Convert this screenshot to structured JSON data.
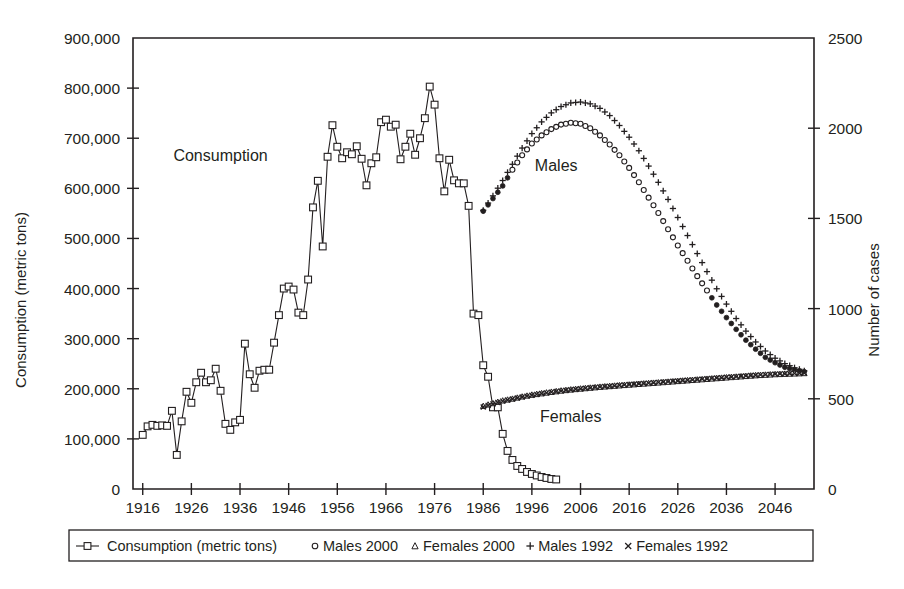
{
  "chart_data": {
    "type": "line",
    "title": "",
    "subtitle": "",
    "xlabel": "",
    "ylabel": "Consumption (metric tons)",
    "y2label": "Number of cases",
    "xlim": [
      1914,
      2054
    ],
    "ylim": [
      0,
      900000
    ],
    "y2lim": [
      0,
      2500
    ],
    "grid": false,
    "legend_position": "bottom",
    "x_ticks": [
      1916,
      1926,
      1936,
      1946,
      1956,
      1966,
      1976,
      1986,
      1996,
      2006,
      2016,
      2026,
      2036,
      2046
    ],
    "x_tick_labels": [
      "1916",
      "1926",
      "1936",
      "1946",
      "1956",
      "1966",
      "1976",
      "1986",
      "1996",
      "2006",
      "2016",
      "2026",
      "2036",
      "2046"
    ],
    "y_ticks": [
      0,
      100000,
      200000,
      300000,
      400000,
      500000,
      600000,
      700000,
      800000,
      900000
    ],
    "y_tick_labels": [
      "0",
      "100,000",
      "200,000",
      "300,000",
      "400,000",
      "500,000",
      "600,000",
      "700,000",
      "800,000",
      "900,000"
    ],
    "y2_ticks": [
      0,
      500,
      1000,
      1500,
      2000,
      2500
    ],
    "y2_tick_labels": [
      "0",
      "500",
      "1000",
      "1500",
      "2000",
      "2500"
    ],
    "annotations": [
      {
        "text": "Consumption",
        "x": 1932,
        "y": 655000,
        "axis": "left"
      },
      {
        "text": "Males",
        "x": 2001,
        "y": 1760,
        "axis": "right"
      },
      {
        "text": "Females",
        "x": 2004,
        "y": 370,
        "axis": "right"
      }
    ],
    "series": [
      {
        "name": "Consumption (metric tons)",
        "axis": "left",
        "marker": "open-square",
        "line": true,
        "x": [
          1916,
          1917,
          1918,
          1919,
          1920,
          1921,
          1922,
          1923,
          1924,
          1925,
          1926,
          1927,
          1928,
          1929,
          1930,
          1931,
          1932,
          1933,
          1934,
          1935,
          1936,
          1937,
          1938,
          1939,
          1940,
          1941,
          1942,
          1943,
          1944,
          1945,
          1946,
          1947,
          1948,
          1949,
          1950,
          1951,
          1952,
          1953,
          1954,
          1955,
          1956,
          1957,
          1958,
          1959,
          1960,
          1961,
          1962,
          1963,
          1964,
          1965,
          1966,
          1967,
          1968,
          1969,
          1970,
          1971,
          1972,
          1973,
          1974,
          1975,
          1976,
          1977,
          1978,
          1979,
          1980,
          1981,
          1982,
          1983,
          1984,
          1985,
          1986,
          1987,
          1988,
          1989,
          1990,
          1991,
          1992,
          1993,
          1994,
          1995,
          1996,
          1997,
          1998,
          1999,
          2000,
          2001
        ],
        "values": [
          108000,
          125000,
          128000,
          126000,
          127000,
          126000,
          156000,
          68000,
          135000,
          194000,
          172000,
          213000,
          232000,
          213000,
          217000,
          240000,
          196000,
          130000,
          118000,
          133000,
          138000,
          290000,
          229000,
          202000,
          236000,
          238000,
          238000,
          292000,
          347000,
          400000,
          404000,
          398000,
          352000,
          347000,
          418000,
          562000,
          615000,
          484000,
          663000,
          726000,
          683000,
          660000,
          672000,
          668000,
          684000,
          659000,
          606000,
          650000,
          662000,
          732000,
          737000,
          723000,
          727000,
          658000,
          683000,
          709000,
          667000,
          700000,
          740000,
          803000,
          767000,
          660000,
          594000,
          657000,
          616000,
          610000,
          610000,
          565000,
          350000,
          347000,
          247000,
          224000,
          163000,
          163000,
          110000,
          76000,
          58000,
          46000,
          40000,
          34000,
          30000,
          27000,
          24000,
          22000,
          20000,
          19000
        ]
      },
      {
        "name": "Males 2000",
        "axis": "right",
        "marker": "open-circle",
        "line": false,
        "x": [
          1986,
          1988,
          1990,
          1992,
          1994,
          1996,
          1998,
          2000,
          2002,
          2004,
          2006,
          2008,
          2010,
          2012,
          2014,
          2016,
          2018,
          2020,
          2022,
          2024,
          2026,
          2028,
          2030,
          2032,
          2034,
          2036,
          2038,
          2040,
          2042,
          2044,
          2046,
          2048,
          2050,
          2052
        ],
        "values": [
          1540,
          1610,
          1680,
          1770,
          1850,
          1915,
          1960,
          1995,
          2020,
          2030,
          2025,
          2000,
          1960,
          1910,
          1850,
          1780,
          1700,
          1615,
          1530,
          1440,
          1350,
          1265,
          1180,
          1100,
          1020,
          950,
          885,
          825,
          775,
          730,
          700,
          675,
          660,
          650
        ]
      },
      {
        "name": "Females 2000",
        "axis": "right",
        "marker": "triangle",
        "line": false,
        "x": [
          1986,
          1988,
          1990,
          1992,
          1994,
          1996,
          1998,
          2000,
          2002,
          2004,
          2006,
          2008,
          2010,
          2012,
          2014,
          2016,
          2018,
          2020,
          2022,
          2024,
          2026,
          2028,
          2030,
          2032,
          2034,
          2036,
          2038,
          2040,
          2042,
          2044,
          2046,
          2048,
          2050,
          2052
        ],
        "values": [
          460,
          475,
          490,
          500,
          512,
          522,
          530,
          538,
          545,
          551,
          556,
          561,
          566,
          570,
          574,
          578,
          582,
          586,
          590,
          594,
          598,
          602,
          606,
          610,
          614,
          618,
          622,
          626,
          630,
          633,
          636,
          638,
          640,
          642
        ]
      },
      {
        "name": "Males 1992",
        "axis": "right",
        "marker": "plus",
        "line": false,
        "x": [
          1986,
          1988,
          1990,
          1992,
          1994,
          1996,
          1998,
          2000,
          2002,
          2004,
          2006,
          2008,
          2010,
          2012,
          2014,
          2016,
          2018,
          2020,
          2022,
          2024,
          2026,
          2028,
          2030,
          2032,
          2034,
          2036,
          2038,
          2040,
          2042,
          2044,
          2046,
          2048,
          2050,
          2052
        ],
        "values": [
          1545,
          1625,
          1710,
          1800,
          1890,
          1970,
          2035,
          2085,
          2120,
          2140,
          2145,
          2135,
          2110,
          2070,
          2015,
          1950,
          1875,
          1790,
          1700,
          1605,
          1505,
          1405,
          1305,
          1205,
          1110,
          1025,
          945,
          875,
          815,
          765,
          725,
          695,
          672,
          655
        ]
      },
      {
        "name": "Females 1992",
        "axis": "right",
        "marker": "cross",
        "line": false,
        "x": [
          1986,
          1988,
          1990,
          1992,
          1994,
          1996,
          1998,
          2000,
          2002,
          2004,
          2006,
          2008,
          2010,
          2012,
          2014,
          2016,
          2018,
          2020,
          2022,
          2024,
          2026,
          2028,
          2030,
          2032,
          2034,
          2036,
          2038,
          2040,
          2042,
          2044,
          2046,
          2048,
          2050,
          2052
        ],
        "values": [
          455,
          472,
          487,
          499,
          510,
          520,
          529,
          537,
          544,
          550,
          556,
          561,
          566,
          570,
          575,
          579,
          583,
          587,
          591,
          595,
          599,
          603,
          607,
          611,
          615,
          619,
          623,
          627,
          631,
          634,
          637,
          639,
          641,
          643
        ]
      }
    ]
  },
  "legend": {
    "items": [
      {
        "label": "Consumption (metric tons)",
        "marker": "line-open-square"
      },
      {
        "label": "Males 2000",
        "marker": "open-circle"
      },
      {
        "label": "Females 2000",
        "marker": "triangle"
      },
      {
        "label": "Males 1992",
        "marker": "plus"
      },
      {
        "label": "Females 1992",
        "marker": "cross"
      }
    ]
  },
  "colors": {
    "ink": "#231f20",
    "background": "#ffffff"
  }
}
